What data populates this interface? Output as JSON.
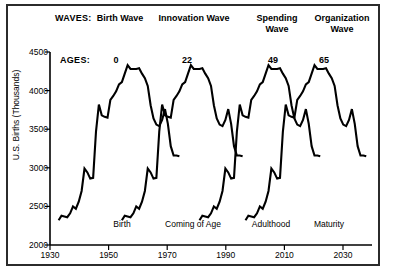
{
  "chart_data": {
    "type": "line",
    "title": "",
    "xlabel": "",
    "ylabel": "U.S. Births (Thousands)",
    "xlim": [
      1930,
      2042
    ],
    "ylim": [
      2000,
      4500
    ],
    "grid": false,
    "legend": "none",
    "xticks": [
      1930,
      1950,
      1970,
      1990,
      2010,
      2030
    ],
    "yticks": [
      2000,
      2500,
      3000,
      3500,
      4000,
      4500
    ],
    "waves_row_label": "WAVES:",
    "ages_row_label": "AGES:",
    "series": [
      {
        "name": "Birth Wave",
        "age_offset": 0,
        "age_label": "0",
        "phase_label": "Birth",
        "header_line1": "Birth Wave",
        "header_line2": ""
      },
      {
        "name": "Innovation Wave",
        "age_offset": 22,
        "age_label": "22",
        "phase_label": "Coming of Age",
        "header_line1": "Innovation Wave",
        "header_line2": ""
      },
      {
        "name": "Spending Wave",
        "age_offset": 49,
        "age_label": "49",
        "phase_label": "Adulthood",
        "header_line1": "Spending",
        "header_line2": "Wave"
      },
      {
        "name": "Organization Wave",
        "age_offset": 65,
        "age_label": "65",
        "phase_label": "Maturity",
        "header_line1": "Organization",
        "header_line2": "Wave"
      }
    ],
    "base_curve_name": "U.S. Births",
    "x": [
      1933,
      1934,
      1935,
      1936,
      1937,
      1938,
      1939,
      1940,
      1941,
      1942,
      1943,
      1944,
      1945,
      1946,
      1947,
      1948,
      1949,
      1950,
      1951,
      1952,
      1953,
      1954,
      1955,
      1956,
      1957,
      1958,
      1959,
      1960,
      1961,
      1962,
      1963,
      1964,
      1965,
      1966,
      1967,
      1968,
      1969,
      1970,
      1971,
      1972,
      1973,
      1974,
      1975
    ],
    "values": [
      2320,
      2380,
      2370,
      2360,
      2410,
      2500,
      2470,
      2560,
      2700,
      2990,
      2940,
      2860,
      2870,
      3470,
      3820,
      3680,
      3660,
      3650,
      3880,
      3930,
      3990,
      4080,
      4110,
      4220,
      4330,
      4280,
      4280,
      4280,
      4290,
      4220,
      4160,
      4060,
      3810,
      3640,
      3560,
      3540,
      3620,
      3760,
      3570,
      3280,
      3160,
      3160,
      3150
    ],
    "note_axis_unit": "Thousands"
  },
  "axis": {
    "ylabel": "U.S. Births (Thousands)",
    "yticks": [
      "4500",
      "4000",
      "3500",
      "3000",
      "2500",
      "2000"
    ],
    "xticks": [
      "1930",
      "1950",
      "1970",
      "1990",
      "2010",
      "2030"
    ]
  },
  "rows": {
    "waves_label": "WAVES:",
    "ages_label": "AGES:"
  }
}
